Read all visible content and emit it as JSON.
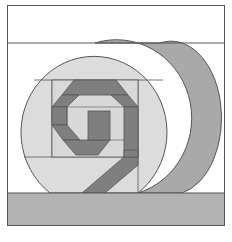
{
  "artwork": {
    "description": "Quilt block: knot motif in circle with crescent",
    "colors": {
      "background": "#ffffff",
      "outline": "#555555",
      "circle_fill": "#dcdcdc",
      "crescent_fill": "#a9a9a9",
      "ground_fill": "#b3b3b3",
      "knot_fill": "#7f7f7f",
      "panel_fill": "#d4d4d4"
    }
  }
}
